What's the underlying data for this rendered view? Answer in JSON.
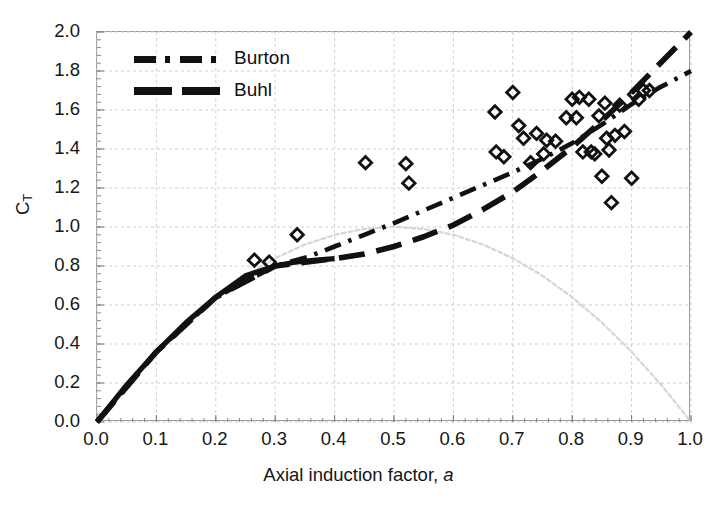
{
  "chart_data": {
    "type": "scatter",
    "title": "",
    "xlabel": "Axial induction factor, a",
    "ylabel": "C_T",
    "ylabel_base": "C",
    "ylabel_sub": "T",
    "xlim": [
      0.0,
      1.0
    ],
    "ylim": [
      0.0,
      2.0
    ],
    "xticks": [
      "0.0",
      "0.1",
      "0.2",
      "0.3",
      "0.4",
      "0.5",
      "0.6",
      "0.7",
      "0.8",
      "0.9",
      "1.0"
    ],
    "xtick_values": [
      0.0,
      0.1,
      0.2,
      0.3,
      0.4,
      0.5,
      0.6,
      0.7,
      0.8,
      0.9,
      1.0
    ],
    "yticks": [
      "0.0",
      "0.2",
      "0.4",
      "0.6",
      "0.8",
      "1.0",
      "1.2",
      "1.4",
      "1.6",
      "1.8",
      "2.0"
    ],
    "ytick_values": [
      0.0,
      0.2,
      0.4,
      0.6,
      0.8,
      1.0,
      1.2,
      1.4,
      1.6,
      1.8,
      2.0
    ],
    "grid": true,
    "legend_position": "top-left",
    "legend": [
      {
        "label": "Burton",
        "style": "dash-dot",
        "color": "#111111"
      },
      {
        "label": "Buhl",
        "style": "long-dash",
        "color": "#111111"
      }
    ],
    "series": [
      {
        "name": "Momentum theory (thick solid)",
        "style": "solid-thick",
        "color": "#111111",
        "points": [
          [
            0.0,
            0.0
          ],
          [
            0.05,
            0.19
          ],
          [
            0.1,
            0.36
          ],
          [
            0.15,
            0.51
          ],
          [
            0.2,
            0.64
          ],
          [
            0.25,
            0.75
          ],
          [
            0.3,
            0.8
          ],
          [
            0.33,
            0.818
          ],
          [
            0.36,
            0.828
          ],
          [
            0.4,
            0.838
          ]
        ]
      },
      {
        "name": "Momentum theory parabola 4a(1-a)",
        "style": "faint-dotted",
        "color": "#d5d5d5",
        "points": [
          [
            0.0,
            0.0
          ],
          [
            0.05,
            0.19
          ],
          [
            0.1,
            0.36
          ],
          [
            0.15,
            0.51
          ],
          [
            0.2,
            0.64
          ],
          [
            0.25,
            0.75
          ],
          [
            0.3,
            0.84
          ],
          [
            0.35,
            0.91
          ],
          [
            0.4,
            0.96
          ],
          [
            0.45,
            0.99
          ],
          [
            0.5,
            1.0
          ],
          [
            0.55,
            0.99
          ],
          [
            0.6,
            0.96
          ],
          [
            0.65,
            0.91
          ],
          [
            0.7,
            0.84
          ],
          [
            0.75,
            0.75
          ],
          [
            0.8,
            0.64
          ],
          [
            0.85,
            0.51
          ],
          [
            0.9,
            0.36
          ],
          [
            0.95,
            0.19
          ],
          [
            1.0,
            0.0
          ]
        ]
      },
      {
        "name": "Burton",
        "style": "dash-dot",
        "color": "#111111",
        "points": [
          [
            0.0,
            0.0
          ],
          [
            0.1,
            0.36
          ],
          [
            0.2,
            0.64
          ],
          [
            0.3,
            0.8
          ],
          [
            0.3539,
            0.845
          ],
          [
            0.4,
            0.9
          ],
          [
            0.45,
            0.96
          ],
          [
            0.5,
            1.02
          ],
          [
            0.55,
            1.085
          ],
          [
            0.6,
            1.15
          ],
          [
            0.65,
            1.215
          ],
          [
            0.7,
            1.28
          ],
          [
            0.75,
            1.35
          ],
          [
            0.8,
            1.43
          ],
          [
            0.85,
            1.525
          ],
          [
            0.9,
            1.63
          ],
          [
            0.95,
            1.72
          ],
          [
            1.0,
            1.8
          ]
        ]
      },
      {
        "name": "Buhl",
        "style": "long-dash",
        "color": "#111111",
        "points": [
          [
            0.0,
            0.0
          ],
          [
            0.1,
            0.36
          ],
          [
            0.2,
            0.64
          ],
          [
            0.3,
            0.8
          ],
          [
            0.4,
            0.838
          ],
          [
            0.45,
            0.862
          ],
          [
            0.5,
            0.9
          ],
          [
            0.55,
            0.95
          ],
          [
            0.6,
            1.01
          ],
          [
            0.65,
            1.09
          ],
          [
            0.7,
            1.18
          ],
          [
            0.75,
            1.29
          ],
          [
            0.8,
            1.41
          ],
          [
            0.85,
            1.545
          ],
          [
            0.9,
            1.69
          ],
          [
            0.95,
            1.845
          ],
          [
            1.0,
            2.0
          ]
        ]
      }
    ],
    "scatter": {
      "name": "Measured data",
      "marker": "open-diamond",
      "color": "#111111",
      "points": [
        [
          0.265,
          0.83
        ],
        [
          0.29,
          0.82
        ],
        [
          0.337,
          0.96
        ],
        [
          0.452,
          1.33
        ],
        [
          0.52,
          1.325
        ],
        [
          0.525,
          1.225
        ],
        [
          0.67,
          1.59
        ],
        [
          0.672,
          1.385
        ],
        [
          0.685,
          1.36
        ],
        [
          0.7,
          1.69
        ],
        [
          0.71,
          1.52
        ],
        [
          0.718,
          1.455
        ],
        [
          0.73,
          1.33
        ],
        [
          0.74,
          1.48
        ],
        [
          0.752,
          1.375
        ],
        [
          0.757,
          1.445
        ],
        [
          0.772,
          1.44
        ],
        [
          0.79,
          1.56
        ],
        [
          0.8,
          1.655
        ],
        [
          0.807,
          1.56
        ],
        [
          0.812,
          1.665
        ],
        [
          0.818,
          1.385
        ],
        [
          0.828,
          1.655
        ],
        [
          0.832,
          1.385
        ],
        [
          0.838,
          1.375
        ],
        [
          0.845,
          1.57
        ],
        [
          0.85,
          1.26
        ],
        [
          0.855,
          1.635
        ],
        [
          0.858,
          1.455
        ],
        [
          0.862,
          1.395
        ],
        [
          0.866,
          1.125
        ],
        [
          0.872,
          1.47
        ],
        [
          0.88,
          1.625
        ],
        [
          0.888,
          1.49
        ],
        [
          0.9,
          1.25
        ],
        [
          0.905,
          1.68
        ],
        [
          0.912,
          1.655
        ],
        [
          0.92,
          1.7
        ],
        [
          0.93,
          1.7
        ]
      ]
    }
  }
}
